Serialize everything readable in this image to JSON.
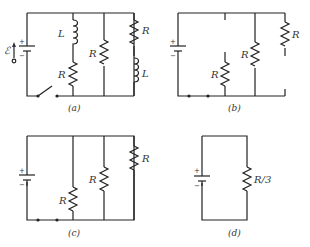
{
  "diagrams": [
    {
      "id": "a",
      "caption": "(a)",
      "emf_label": "ℰ",
      "battery_plus": "+",
      "battery_minus": "−",
      "branches": [
        {
          "components": [
            "L",
            "R"
          ]
        },
        {
          "components": [
            "R"
          ]
        },
        {
          "components": [
            "R",
            "L"
          ]
        }
      ],
      "switch": "open"
    },
    {
      "id": "b",
      "caption": "(b)",
      "battery_plus": "+",
      "battery_minus": "−",
      "branches": [
        {
          "components": [
            "R"
          ],
          "note": "open at top"
        },
        {
          "components": [
            "R"
          ]
        },
        {
          "components": [
            "R"
          ],
          "note": "open at bottom"
        }
      ]
    },
    {
      "id": "c",
      "caption": "(c)",
      "battery_plus": "+",
      "battery_minus": "−",
      "branches": [
        {
          "components": [
            "R"
          ]
        },
        {
          "components": [
            "R"
          ]
        },
        {
          "components": [
            "R"
          ]
        }
      ]
    },
    {
      "id": "d",
      "caption": "(d)",
      "battery_plus": "+",
      "battery_minus": "−",
      "branches": [
        {
          "components": [
            "R/3"
          ]
        }
      ]
    }
  ],
  "labels": {
    "L": "L",
    "R": "R",
    "R3": "R/3",
    "emf": "ℰ",
    "plus": "+",
    "minus": "−",
    "cap_a": "(a)",
    "cap_b": "(b)",
    "cap_c": "(c)",
    "cap_d": "(d)"
  }
}
